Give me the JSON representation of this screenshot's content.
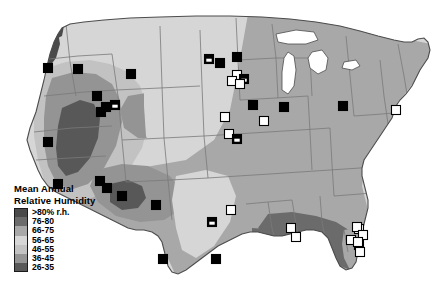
{
  "figure": {
    "name": "mean-annual-relative-humidity-map",
    "region": "Contiguous United States",
    "background_color": "#ffffff",
    "outline_color": "#4d4d4d",
    "state_border_color": "#808080"
  },
  "legend": {
    "title": "Mean Annual\nRelative Humidity",
    "entries": [
      {
        "label": ">80% r.h.",
        "color": "#4a4a4a"
      },
      {
        "label": "76-80",
        "color": "#6b6b6b"
      },
      {
        "label": "66-75",
        "color": "#a8a8a8"
      },
      {
        "label": "56-65",
        "color": "#d6d6d6"
      },
      {
        "label": "46-55",
        "color": "#c2c2c2"
      },
      {
        "label": "36-45",
        "color": "#949494"
      },
      {
        "label": "26-35",
        "color": "#585858"
      }
    ]
  },
  "chart_data": {
    "type": "map",
    "title": "Mean Annual Relative Humidity",
    "legend_position": "bottom-left",
    "classes": [
      {
        "label": ">80% r.h.",
        "range": [
          80,
          100
        ],
        "color": "#4a4a4a"
      },
      {
        "label": "76-80",
        "range": [
          76,
          80
        ],
        "color": "#6b6b6b"
      },
      {
        "label": "66-75",
        "range": [
          66,
          75
        ],
        "color": "#a8a8a8"
      },
      {
        "label": "56-65",
        "range": [
          56,
          65
        ],
        "color": "#d6d6d6"
      },
      {
        "label": "46-55",
        "range": [
          46,
          55
        ],
        "color": "#c2c2c2"
      },
      {
        "label": "36-45",
        "range": [
          36,
          45
        ],
        "color": "#949494"
      },
      {
        "label": "26-35",
        "range": [
          26,
          35
        ],
        "color": "#585858"
      }
    ],
    "symbols": {
      "filled": "black square",
      "open": "white outlined square",
      "half": "black square with white inset"
    },
    "sites": [
      {
        "x": 131,
        "y": 74,
        "type": "filled"
      },
      {
        "x": 78,
        "y": 69,
        "type": "filled"
      },
      {
        "x": 48,
        "y": 68,
        "type": "filled"
      },
      {
        "x": 97,
        "y": 96,
        "type": "filled"
      },
      {
        "x": 106,
        "y": 107,
        "type": "filled"
      },
      {
        "x": 115,
        "y": 105,
        "type": "half"
      },
      {
        "x": 101,
        "y": 112,
        "type": "filled"
      },
      {
        "x": 48,
        "y": 142,
        "type": "filled"
      },
      {
        "x": 58,
        "y": 184,
        "type": "filled"
      },
      {
        "x": 107,
        "y": 188,
        "type": "filled"
      },
      {
        "x": 100,
        "y": 181,
        "type": "filled"
      },
      {
        "x": 122,
        "y": 196,
        "type": "filled"
      },
      {
        "x": 156,
        "y": 205,
        "type": "filled"
      },
      {
        "x": 163,
        "y": 259,
        "type": "filled"
      },
      {
        "x": 209,
        "y": 59,
        "type": "half"
      },
      {
        "x": 220,
        "y": 63,
        "type": "filled"
      },
      {
        "x": 237,
        "y": 57,
        "type": "filled"
      },
      {
        "x": 253,
        "y": 105,
        "type": "filled"
      },
      {
        "x": 237,
        "y": 75,
        "type": "open"
      },
      {
        "x": 244,
        "y": 79,
        "type": "half"
      },
      {
        "x": 232,
        "y": 81,
        "type": "open"
      },
      {
        "x": 240,
        "y": 84,
        "type": "open"
      },
      {
        "x": 225,
        "y": 117,
        "type": "open"
      },
      {
        "x": 229,
        "y": 134,
        "type": "open"
      },
      {
        "x": 237,
        "y": 139,
        "type": "half"
      },
      {
        "x": 264,
        "y": 121,
        "type": "open"
      },
      {
        "x": 284,
        "y": 107,
        "type": "filled"
      },
      {
        "x": 212,
        "y": 222,
        "type": "half"
      },
      {
        "x": 231,
        "y": 210,
        "type": "open"
      },
      {
        "x": 216,
        "y": 259,
        "type": "filled"
      },
      {
        "x": 291,
        "y": 228,
        "type": "open"
      },
      {
        "x": 343,
        "y": 106,
        "type": "filled"
      },
      {
        "x": 396,
        "y": 110,
        "type": "open"
      },
      {
        "x": 296,
        "y": 237,
        "type": "open"
      },
      {
        "x": 351,
        "y": 240,
        "type": "open"
      },
      {
        "x": 359,
        "y": 229,
        "type": "open"
      },
      {
        "x": 357,
        "y": 227,
        "type": "open"
      },
      {
        "x": 359,
        "y": 245,
        "type": "open"
      },
      {
        "x": 363,
        "y": 235,
        "type": "open"
      },
      {
        "x": 358,
        "y": 242,
        "type": "open"
      },
      {
        "x": 360,
        "y": 252,
        "type": "open"
      }
    ]
  }
}
